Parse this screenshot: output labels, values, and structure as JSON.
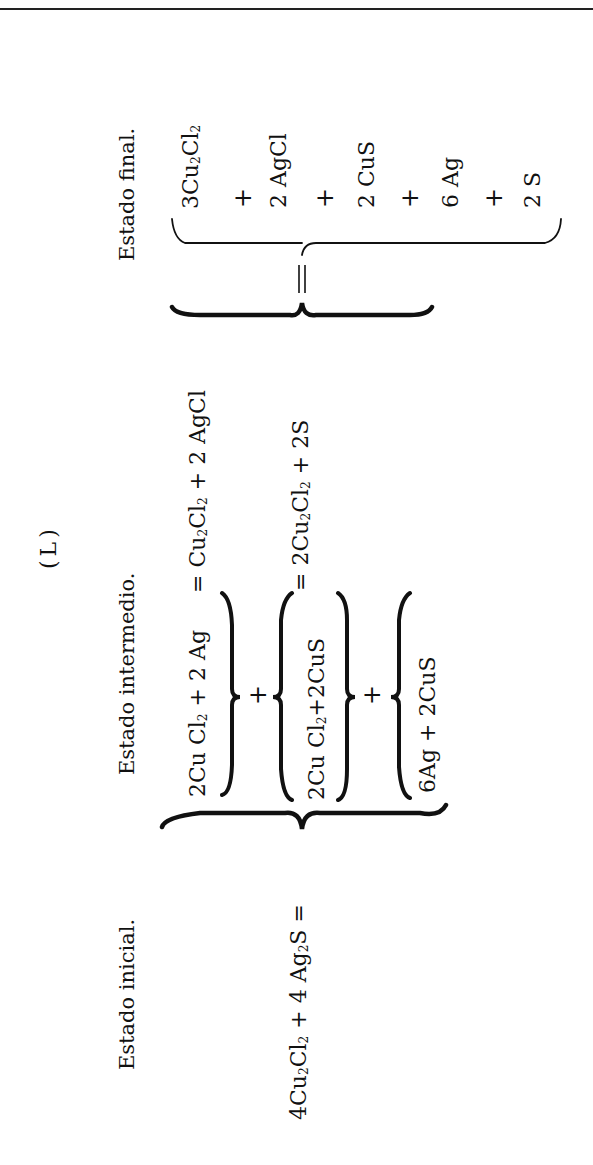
{
  "figure_label": "(L)",
  "states": {
    "initial": {
      "label": "Estado inicial.",
      "equation": {
        "t1": "4Cu",
        "s1": "2",
        "t2": "Cl",
        "s2": "2",
        "t3": " + 4 Ag",
        "s3": "2",
        "t4": "S",
        "eq": " ="
      }
    },
    "intermediate": {
      "label": "Estado intermedio.",
      "rows": [
        {
          "lhs": {
            "t1": "2Cu Cl",
            "s1": "2",
            "t2": " + 2 Ag"
          },
          "rhs": {
            "eq": "= ",
            "t1": "Cu",
            "s1": "2",
            "t2": "Cl",
            "s2": "2",
            "t3": " + 2 AgCl"
          }
        },
        {
          "lhs": {
            "t1": "2Cu Cl",
            "s1": "2",
            "t2": "+2CuS"
          },
          "rhs": {
            "eq": "= ",
            "t1": "2Cu",
            "s1": "2",
            "t2": "Cl",
            "s2": "2",
            "t3": " + 2S"
          }
        },
        {
          "lhs": {
            "t1": "6Ag + 2CuS"
          }
        }
      ],
      "plus": "+",
      "equals": "="
    },
    "final": {
      "label": "Estado final.",
      "items": [
        {
          "t1": "3Cu",
          "s1": "2",
          "t2": "Cl",
          "s2": "2"
        },
        {
          "t1": "2 AgCl"
        },
        {
          "t1": "2 CuS"
        },
        {
          "t1": "6 Ag"
        },
        {
          "t1": "2 S"
        }
      ],
      "plus": "+"
    }
  },
  "colors": {
    "ink": "#111111",
    "paper": "#ffffff"
  }
}
